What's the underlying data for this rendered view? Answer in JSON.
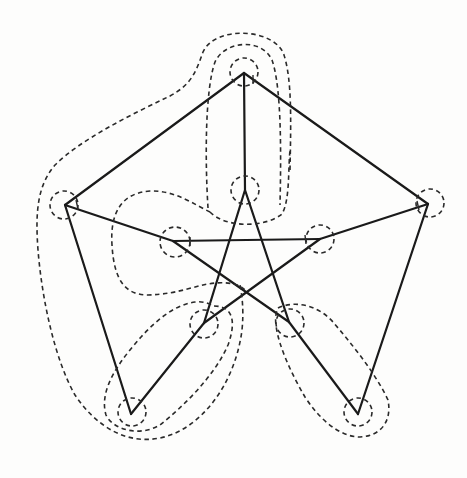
{
  "figure": {
    "edge_color": "#1a1a1a",
    "contour_color": "#2a2a2a",
    "background": "#fdfdfc"
  },
  "vertices": {
    "outer": [
      {
        "id": "T",
        "x": 244,
        "y": 73
      },
      {
        "id": "R",
        "x": 428,
        "y": 204
      },
      {
        "id": "BR",
        "x": 358,
        "y": 414
      },
      {
        "id": "BL",
        "x": 131,
        "y": 414
      },
      {
        "id": "L",
        "x": 65,
        "y": 205
      }
    ],
    "inner": [
      {
        "id": "iT",
        "x": 245,
        "y": 190
      },
      {
        "id": "iR",
        "x": 320,
        "y": 239
      },
      {
        "id": "iBR",
        "x": 289,
        "y": 322
      },
      {
        "id": "iBL",
        "x": 204,
        "y": 323
      },
      {
        "id": "iL",
        "x": 173,
        "y": 241
      }
    ]
  },
  "edges": {
    "outer_cycle": [
      [
        "T",
        "R"
      ],
      [
        "R",
        "BR"
      ],
      [
        "BR",
        "BL"
      ],
      [
        "BL",
        "L"
      ],
      [
        "L",
        "T"
      ]
    ],
    "spokes": [
      [
        "T",
        "iT"
      ],
      [
        "R",
        "iR"
      ],
      [
        "BR",
        "iBR"
      ],
      [
        "BL",
        "iBL"
      ],
      [
        "L",
        "iL"
      ]
    ],
    "pentagram": [
      [
        "iT",
        "iBL"
      ],
      [
        "iT",
        "iBR"
      ],
      [
        "iL",
        "iR"
      ],
      [
        "iL",
        "iBR"
      ],
      [
        "iR",
        "iBL"
      ]
    ]
  },
  "note": "Outer pentagon edges T–L and T–R are drawn; bottom edge BL–BR omitted as in image (pentagon sides form V shapes at bottom)"
}
